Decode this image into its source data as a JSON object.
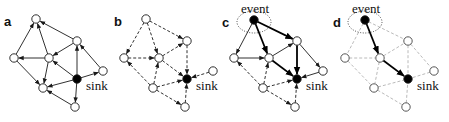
{
  "figure": {
    "panels": [
      {
        "id": "a",
        "label": "a",
        "offset_x": 0,
        "label_pos": [
          4,
          26
        ],
        "sink_label": "sink",
        "style": "solid",
        "edges": [
          [
            "Left",
            "Top"
          ],
          [
            "Center",
            "Top"
          ],
          [
            "TopRight",
            "Top"
          ],
          [
            "Center",
            "Left"
          ],
          [
            "TopRight",
            "Center"
          ],
          [
            "Sink",
            "TopRight"
          ],
          [
            "Right",
            "TopRight"
          ],
          [
            "Sink",
            "Right"
          ],
          [
            "Sink",
            "Center"
          ],
          [
            "Left",
            "BottomCenter"
          ],
          [
            "Center",
            "BottomCenter"
          ],
          [
            "Sink",
            "BottomCenter"
          ],
          [
            "Sink",
            "Bottom"
          ],
          [
            "Bottom",
            "BottomCenter"
          ]
        ]
      },
      {
        "id": "b",
        "label": "b",
        "offset_x": 110,
        "label_pos": [
          114,
          26
        ],
        "sink_label": "sink",
        "style": "dashed",
        "edges": [
          [
            "Top",
            "Left"
          ],
          [
            "Top",
            "Center"
          ],
          [
            "Top",
            "TopRight"
          ],
          [
            "Left",
            "Center"
          ],
          [
            "Center",
            "TopRight"
          ],
          [
            "TopRight",
            "Sink"
          ],
          [
            "Right",
            "Sink"
          ],
          [
            "Center",
            "Sink"
          ],
          [
            "BottomCenter",
            "Left"
          ],
          [
            "BottomCenter",
            "Center"
          ],
          [
            "BottomCenter",
            "Sink"
          ],
          [
            "Bottom",
            "Sink"
          ],
          [
            "BottomCenter",
            "Bottom"
          ]
        ]
      },
      {
        "id": "c",
        "label": "c",
        "offset_x": 220,
        "label_pos": [
          222,
          27
        ],
        "sink_label": "sink",
        "event_label": "event",
        "style": "mixed",
        "edges": [
          [
            "Event",
            "Left",
            "thin"
          ],
          [
            "Event",
            "Center",
            "bold"
          ],
          [
            "Event",
            "TopRight",
            "bold"
          ],
          [
            "Left",
            "Center",
            "thin"
          ],
          [
            "Center",
            "TopRight",
            "thin"
          ],
          [
            "TopRight",
            "Sink",
            "bold"
          ],
          [
            "Center",
            "Sink",
            "bold"
          ],
          [
            "TopRight",
            "Right",
            "thin"
          ],
          [
            "Right",
            "Sink",
            "thin"
          ],
          [
            "BottomCenter",
            "Left",
            "dashed"
          ],
          [
            "BottomCenter",
            "Center",
            "dashed"
          ],
          [
            "BottomCenter",
            "Sink",
            "dashed"
          ],
          [
            "BottomCenter",
            "Bottom",
            "dashed"
          ],
          [
            "Bottom",
            "Sink",
            "dashed"
          ]
        ]
      },
      {
        "id": "d",
        "label": "d",
        "offset_x": 331,
        "label_pos": [
          333,
          27
        ],
        "sink_label": "sink",
        "event_label": "event",
        "style": "path",
        "edges": [
          [
            "Event",
            "Center",
            "bold"
          ],
          [
            "Center",
            "Sink",
            "bold"
          ],
          [
            "Event",
            "Left",
            "gray"
          ],
          [
            "Event",
            "TopRight",
            "gray"
          ],
          [
            "Left",
            "Center",
            "gray"
          ],
          [
            "Center",
            "TopRight",
            "gray"
          ],
          [
            "TopRight",
            "Sink",
            "gray"
          ],
          [
            "TopRight",
            "Right",
            "gray"
          ],
          [
            "Right",
            "Sink",
            "gray"
          ],
          [
            "Left",
            "BottomCenter",
            "gray"
          ],
          [
            "Center",
            "BottomCenter",
            "gray"
          ],
          [
            "BottomCenter",
            "Sink",
            "gray"
          ],
          [
            "BottomCenter",
            "Bottom",
            "gray"
          ],
          [
            "Bottom",
            "Sink",
            "gray"
          ]
        ]
      }
    ],
    "nodes": {
      "Top": [
        36,
        19
      ],
      "Event": [
        34,
        20
      ],
      "Left": [
        14,
        58
      ],
      "Center": [
        49,
        58
      ],
      "TopRight": [
        77,
        41
      ],
      "Right": [
        103,
        71
      ],
      "Sink": [
        77,
        79
      ],
      "BottomCenter": [
        43,
        88
      ],
      "Bottom": [
        75,
        107
      ]
    },
    "colors": {
      "stroke": "#1a1a1a",
      "gray": "#a8a8a8",
      "node_fill": "#ffffff",
      "filled": "#000000"
    }
  }
}
